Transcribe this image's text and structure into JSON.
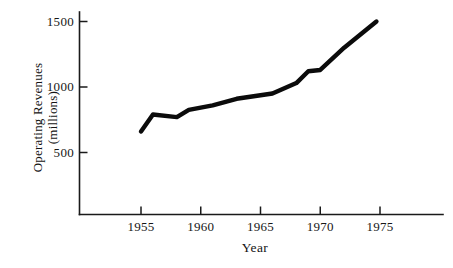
{
  "chart_data": {
    "type": "line",
    "title": "",
    "xlabel": "Year",
    "ylabel": "Operating Revenues (millions)",
    "ylabel_line1": "Operating Revenues",
    "ylabel_line2": "(millions)",
    "x": [
      1955,
      1956,
      1958,
      1959,
      1961,
      1963,
      1966,
      1968,
      1969,
      1970,
      1972,
      1974.7
    ],
    "values": [
      660,
      790,
      770,
      825,
      860,
      910,
      950,
      1030,
      1120,
      1130,
      1300,
      1500
    ],
    "series": [
      {
        "name": "Operating Revenues",
        "values": [
          660,
          790,
          770,
          825,
          860,
          910,
          950,
          1030,
          1120,
          1130,
          1300,
          1500
        ]
      }
    ],
    "xlim": [
      1950.2,
      1980.5
    ],
    "ylim": [
      0,
      1565
    ],
    "xticks": [
      1955,
      1960,
      1965,
      1970,
      1975
    ],
    "xtick_labels": [
      "1955",
      "1960",
      "1965",
      "1970",
      "1975"
    ],
    "yticks": [
      500,
      1000,
      1500
    ],
    "ytick_labels": [
      "500",
      "1000",
      "1500"
    ],
    "grid": false,
    "legend": false,
    "line_color": "#0b0b0b",
    "axis_color": "#1a1a1a",
    "background": "#ffffff"
  },
  "axes": {
    "x_title": "Year",
    "y_title_line1": "Operating Revenues",
    "y_title_line2": "(millions)"
  },
  "ticks": {
    "y": [
      {
        "label": "1500",
        "value": 1500
      },
      {
        "label": "1000",
        "value": 1000
      },
      {
        "label": "500",
        "value": 500
      }
    ],
    "x": [
      {
        "label": "1955",
        "value": 1955
      },
      {
        "label": "1960",
        "value": 1960
      },
      {
        "label": "1965",
        "value": 1965
      },
      {
        "label": "1970",
        "value": 1970
      },
      {
        "label": "1975",
        "value": 1975
      }
    ]
  }
}
